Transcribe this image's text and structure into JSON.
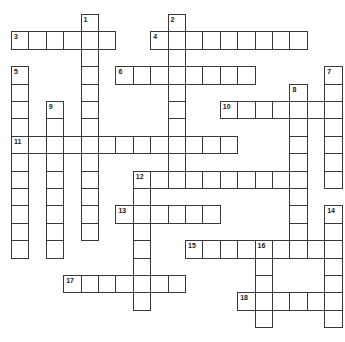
{
  "puzzle": {
    "type": "crossword",
    "grid_origin": {
      "x": 11,
      "y": 14
    },
    "cell_size": 17.4,
    "line_color": "#3a3a3a",
    "cell_color": "#ffffff",
    "across": [
      {
        "number": "3",
        "row": 1,
        "col": 0,
        "length": 6
      },
      {
        "number": "4",
        "row": 1,
        "col": 8,
        "length": 9
      },
      {
        "number": "6",
        "row": 3,
        "col": 6,
        "length": 8
      },
      {
        "number": "10",
        "row": 5,
        "col": 12,
        "length": 7
      },
      {
        "number": "11",
        "row": 7,
        "col": 0,
        "length": 13
      },
      {
        "number": "12",
        "row": 9,
        "col": 7,
        "length": 10
      },
      {
        "number": "13",
        "row": 11,
        "col": 6,
        "length": 6
      },
      {
        "number": "15",
        "row": 13,
        "col": 10,
        "length": 9
      },
      {
        "number": "17",
        "row": 15,
        "col": 3,
        "length": 7
      },
      {
        "number": "18",
        "row": 16,
        "col": 13,
        "length": 6
      }
    ],
    "down": [
      {
        "number": "1",
        "row": 0,
        "col": 4,
        "length": 13
      },
      {
        "number": "2",
        "row": 0,
        "col": 9,
        "length": 10
      },
      {
        "number": "5",
        "row": 3,
        "col": 0,
        "length": 11
      },
      {
        "number": "7",
        "row": 3,
        "col": 18,
        "length": 7
      },
      {
        "number": "8",
        "row": 4,
        "col": 16,
        "length": 10
      },
      {
        "number": "9",
        "row": 5,
        "col": 2,
        "length": 9
      },
      {
        "number": "12",
        "row": 9,
        "col": 7,
        "length": 8
      },
      {
        "number": "14",
        "row": 11,
        "col": 18,
        "length": 7
      },
      {
        "number": "16",
        "row": 13,
        "col": 14,
        "length": 5
      }
    ]
  }
}
